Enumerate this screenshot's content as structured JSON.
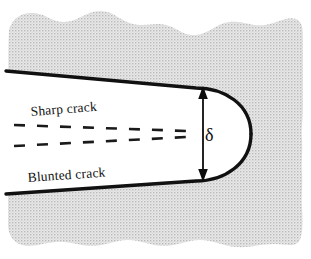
{
  "figure": {
    "background_color": "#ffffff",
    "material_fill_color": "#d6d6d6",
    "crack_fill_color": "#ffffff",
    "outline_color": "#111111"
  },
  "labels": {
    "sharp_crack": "Sharp crack",
    "blunted_crack": "Blunted crack",
    "delta_symbol": "δ"
  },
  "annotations": {
    "dimension_name": "crack-tip-opening-displacement",
    "arrow_top_y": "88",
    "arrow_bottom_y": "180",
    "arrow_x": "203"
  },
  "geometry": {
    "material_left": "8",
    "material_right": "303",
    "material_top": "10",
    "material_bottom": "246",
    "crack_tip_x": "251",
    "upper_edge_left_y": "72",
    "lower_edge_left_y": "193"
  }
}
